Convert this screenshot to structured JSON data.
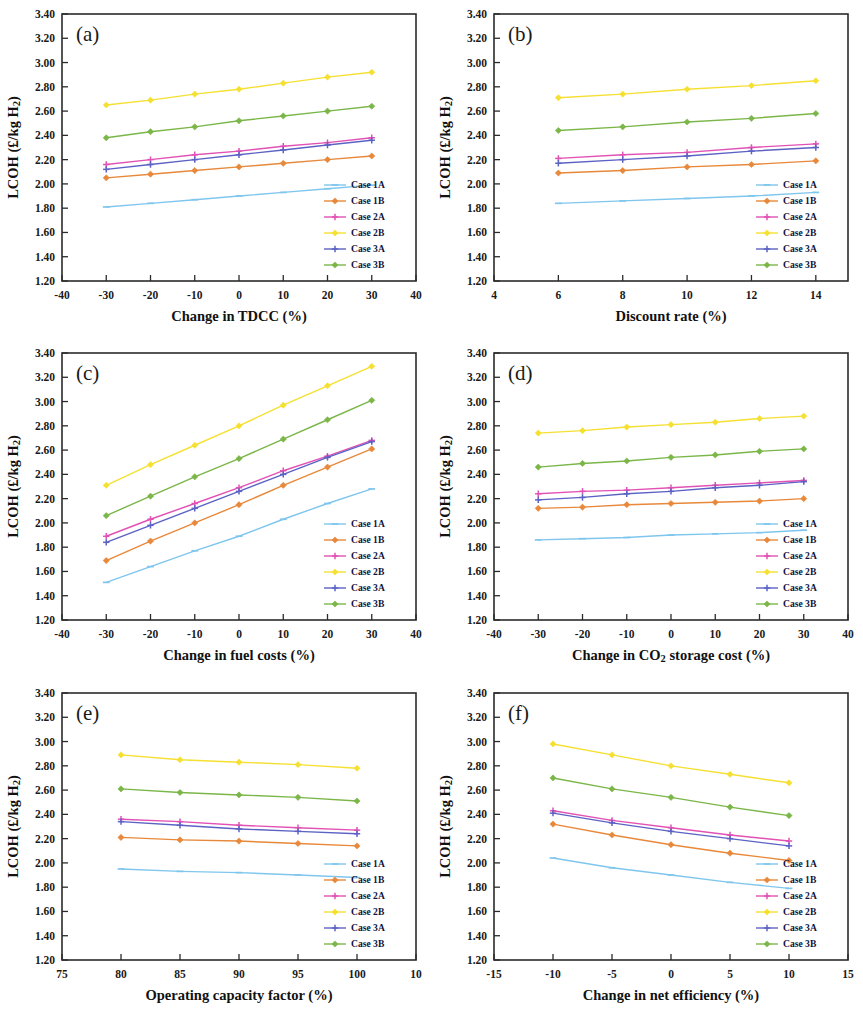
{
  "figure": {
    "y_axis_label": "LCOH (£/kg H",
    "y_axis_label_sub": "2",
    "y_axis_label_tail": ")",
    "y_ticks": [
      "3.40",
      "3.20",
      "3.00",
      "2.80",
      "2.60",
      "2.40",
      "2.20",
      "2.00",
      "1.80",
      "1.60",
      "1.40",
      "1.20"
    ],
    "ylim": [
      1.2,
      3.4
    ]
  },
  "series_style": [
    {
      "name": "Case 1A",
      "color": "#7fc6ee",
      "marker": "dash"
    },
    {
      "name": "Case 1B",
      "color": "#e8883a",
      "marker": "diamond"
    },
    {
      "name": "Case 2A",
      "color": "#e251b4",
      "marker": "plus"
    },
    {
      "name": "Case 2B",
      "color": "#f5e032",
      "marker": "diamond"
    },
    {
      "name": "Case 3A",
      "color": "#5b62c4",
      "marker": "plus"
    },
    {
      "name": "Case 3B",
      "color": "#7ab648",
      "marker": "diamond"
    }
  ],
  "legend": {
    "items": [
      "Case 1A",
      "Case 1B",
      "Case 2A",
      "Case 2B",
      "Case 3A",
      "Case 3B"
    ]
  },
  "chart_data": [
    {
      "panel": "(a)",
      "type": "line",
      "title": "",
      "xlabel": "Change in TDCC (%)",
      "ylabel": "LCOH (£/kg H2)",
      "x_ticks": [
        "-40",
        "-30",
        "-20",
        "-10",
        "0",
        "10",
        "20",
        "30",
        "40"
      ],
      "xlim": [
        -40,
        40
      ],
      "ylim": [
        1.2,
        3.4
      ],
      "grid": false,
      "legend_position": "bottom-right",
      "x": [
        -30,
        -20,
        -10,
        0,
        10,
        20,
        30
      ],
      "series": [
        {
          "name": "Case 1A",
          "values": [
            1.81,
            1.84,
            1.87,
            1.9,
            1.93,
            1.96,
            1.99
          ]
        },
        {
          "name": "Case 1B",
          "values": [
            2.05,
            2.08,
            2.11,
            2.14,
            2.17,
            2.2,
            2.23
          ]
        },
        {
          "name": "Case 2A",
          "values": [
            2.16,
            2.2,
            2.24,
            2.27,
            2.31,
            2.34,
            2.38
          ]
        },
        {
          "name": "Case 2B",
          "values": [
            2.65,
            2.69,
            2.74,
            2.78,
            2.83,
            2.88,
            2.92
          ]
        },
        {
          "name": "Case 3A",
          "values": [
            2.12,
            2.16,
            2.2,
            2.24,
            2.28,
            2.32,
            2.36
          ]
        },
        {
          "name": "Case 3B",
          "values": [
            2.38,
            2.43,
            2.47,
            2.52,
            2.56,
            2.6,
            2.64
          ]
        }
      ]
    },
    {
      "panel": "(b)",
      "type": "line",
      "title": "",
      "xlabel": "Discount rate (%)",
      "ylabel": "LCOH (£/kg H2)",
      "x_ticks": [
        "4",
        "6",
        "8",
        "10",
        "12",
        "14"
      ],
      "xlim": [
        4,
        15
      ],
      "ylim": [
        1.2,
        3.4
      ],
      "grid": false,
      "legend_position": "bottom-right",
      "x": [
        6,
        8,
        10,
        12,
        14
      ],
      "series": [
        {
          "name": "Case 1A",
          "values": [
            1.84,
            1.86,
            1.88,
            1.9,
            1.93
          ]
        },
        {
          "name": "Case 1B",
          "values": [
            2.09,
            2.11,
            2.14,
            2.16,
            2.19
          ]
        },
        {
          "name": "Case 2A",
          "values": [
            2.21,
            2.24,
            2.26,
            2.3,
            2.33
          ]
        },
        {
          "name": "Case 2B",
          "values": [
            2.71,
            2.74,
            2.78,
            2.81,
            2.85
          ]
        },
        {
          "name": "Case 3A",
          "values": [
            2.17,
            2.2,
            2.23,
            2.27,
            2.3
          ]
        },
        {
          "name": "Case 3B",
          "values": [
            2.44,
            2.47,
            2.51,
            2.54,
            2.58
          ]
        }
      ]
    },
    {
      "panel": "(c)",
      "type": "line",
      "title": "",
      "xlabel": "Change in fuel costs (%)",
      "ylabel": "LCOH (£/kg H2)",
      "x_ticks": [
        "-40",
        "-30",
        "-20",
        "-10",
        "0",
        "10",
        "20",
        "30",
        "40"
      ],
      "xlim": [
        -40,
        40
      ],
      "ylim": [
        1.2,
        3.4
      ],
      "grid": false,
      "legend_position": "bottom-right",
      "x": [
        -30,
        -20,
        -10,
        0,
        10,
        20,
        30
      ],
      "series": [
        {
          "name": "Case 1A",
          "values": [
            1.51,
            1.64,
            1.77,
            1.89,
            2.03,
            2.16,
            2.28
          ]
        },
        {
          "name": "Case 1B",
          "values": [
            1.69,
            1.85,
            2.0,
            2.15,
            2.31,
            2.46,
            2.61
          ]
        },
        {
          "name": "Case 2A",
          "values": [
            1.89,
            2.03,
            2.16,
            2.29,
            2.43,
            2.55,
            2.68
          ]
        },
        {
          "name": "Case 2B",
          "values": [
            2.31,
            2.48,
            2.64,
            2.8,
            2.97,
            3.13,
            3.29
          ]
        },
        {
          "name": "Case 3A",
          "values": [
            1.84,
            1.98,
            2.12,
            2.26,
            2.4,
            2.54,
            2.67
          ]
        },
        {
          "name": "Case 3B",
          "values": [
            2.06,
            2.22,
            2.38,
            2.53,
            2.69,
            2.85,
            3.01
          ]
        }
      ]
    },
    {
      "panel": "(d)",
      "type": "line",
      "title": "",
      "xlabel": "Change in CO2 storage cost (%)",
      "xlabel_pre": "Change in CO",
      "xlabel_sub": "2",
      "xlabel_post": " storage cost (%)",
      "ylabel": "LCOH (£/kg H2)",
      "x_ticks": [
        "-40",
        "-30",
        "-20",
        "-10",
        "0",
        "10",
        "20",
        "30",
        "40"
      ],
      "xlim": [
        -40,
        40
      ],
      "ylim": [
        1.2,
        3.4
      ],
      "grid": false,
      "legend_position": "bottom-right",
      "x": [
        -30,
        -20,
        -10,
        0,
        10,
        20,
        30
      ],
      "series": [
        {
          "name": "Case 1A",
          "values": [
            1.86,
            1.87,
            1.88,
            1.9,
            1.91,
            1.92,
            1.94
          ]
        },
        {
          "name": "Case 1B",
          "values": [
            2.12,
            2.13,
            2.15,
            2.16,
            2.17,
            2.18,
            2.2
          ]
        },
        {
          "name": "Case 2A",
          "values": [
            2.24,
            2.26,
            2.27,
            2.29,
            2.31,
            2.33,
            2.35
          ]
        },
        {
          "name": "Case 2B",
          "values": [
            2.74,
            2.76,
            2.79,
            2.81,
            2.83,
            2.86,
            2.88
          ]
        },
        {
          "name": "Case 3A",
          "values": [
            2.19,
            2.21,
            2.24,
            2.26,
            2.29,
            2.31,
            2.34
          ]
        },
        {
          "name": "Case 3B",
          "values": [
            2.46,
            2.49,
            2.51,
            2.54,
            2.56,
            2.59,
            2.61
          ]
        }
      ]
    },
    {
      "panel": "(e)",
      "type": "line",
      "title": "",
      "xlabel": "Operating capacity factor (%)",
      "ylabel": "LCOH (£/kg H2)",
      "x_ticks": [
        "75",
        "80",
        "85",
        "90",
        "95",
        "100",
        "10"
      ],
      "xlim": [
        75,
        105
      ],
      "ylim": [
        1.2,
        3.4
      ],
      "grid": false,
      "legend_position": "bottom-right",
      "x": [
        80,
        85,
        90,
        95,
        100
      ],
      "series": [
        {
          "name": "Case 1A",
          "values": [
            1.95,
            1.93,
            1.92,
            1.9,
            1.88
          ]
        },
        {
          "name": "Case 1B",
          "values": [
            2.21,
            2.19,
            2.18,
            2.16,
            2.14
          ]
        },
        {
          "name": "Case 2A",
          "values": [
            2.36,
            2.34,
            2.31,
            2.29,
            2.27
          ]
        },
        {
          "name": "Case 2B",
          "values": [
            2.89,
            2.85,
            2.83,
            2.81,
            2.78
          ]
        },
        {
          "name": "Case 3A",
          "values": [
            2.34,
            2.31,
            2.28,
            2.26,
            2.24
          ]
        },
        {
          "name": "Case 3B",
          "values": [
            2.61,
            2.58,
            2.56,
            2.54,
            2.51
          ]
        }
      ]
    },
    {
      "panel": "(f)",
      "type": "line",
      "title": "",
      "xlabel": "Change in net efficiency (%)",
      "ylabel": "LCOH (£/kg H2)",
      "x_ticks": [
        "-15",
        "-10",
        "-5",
        "0",
        "5",
        "10",
        "15"
      ],
      "xlim": [
        -15,
        15
      ],
      "ylim": [
        1.2,
        3.4
      ],
      "grid": false,
      "legend_position": "bottom-right",
      "x": [
        -10,
        -5,
        0,
        5,
        10
      ],
      "series": [
        {
          "name": "Case 1A",
          "values": [
            2.04,
            1.96,
            1.9,
            1.84,
            1.79
          ]
        },
        {
          "name": "Case 1B",
          "values": [
            2.32,
            2.23,
            2.15,
            2.08,
            2.02
          ]
        },
        {
          "name": "Case 2A",
          "values": [
            2.43,
            2.35,
            2.29,
            2.23,
            2.18
          ]
        },
        {
          "name": "Case 2B",
          "values": [
            2.98,
            2.89,
            2.8,
            2.73,
            2.66
          ]
        },
        {
          "name": "Case 3A",
          "values": [
            2.41,
            2.33,
            2.26,
            2.2,
            2.14
          ]
        },
        {
          "name": "Case 3B",
          "values": [
            2.7,
            2.61,
            2.54,
            2.46,
            2.39
          ]
        }
      ]
    }
  ]
}
